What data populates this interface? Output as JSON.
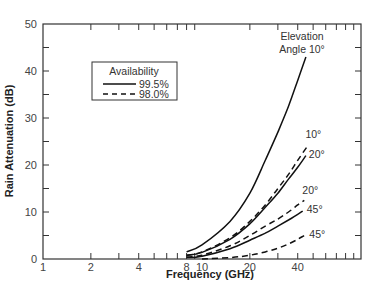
{
  "chart_data": {
    "type": "line",
    "title": "",
    "xlabel": "Frequency (GHz)",
    "ylabel": "Rain Attenuation (dB)",
    "xscale": "log",
    "xlim": [
      1,
      100
    ],
    "ylim": [
      0,
      50
    ],
    "x_tick_labels": [
      "1",
      "2",
      "4",
      "8",
      "10",
      "20",
      "40"
    ],
    "x_tick_values": [
      1,
      2,
      4,
      8,
      10,
      20,
      40
    ],
    "y_tick_labels": [
      "0",
      "10",
      "20",
      "30",
      "40",
      "50"
    ],
    "y_tick_values": [
      0,
      10,
      20,
      30,
      40,
      50
    ],
    "grid": false,
    "legend": {
      "title": "Availability",
      "position": "upper-left",
      "entries": [
        {
          "label": "99.5%",
          "style": "solid"
        },
        {
          "label": "98.0%",
          "style": "dashed"
        }
      ]
    },
    "annotations": [
      {
        "text": "Elevation",
        "x": 45,
        "y": 47
      },
      {
        "text": "Angle 10°",
        "x": 45,
        "y": 44.5
      }
    ],
    "series": [
      {
        "name": "10° (99.5%)",
        "label": "Elevation Angle 10°",
        "style": "solid",
        "x": [
          8,
          10,
          15,
          20,
          25,
          30,
          35,
          40,
          45
        ],
        "y": [
          1.5,
          3,
          8,
          14,
          21,
          27,
          32.5,
          38,
          43
        ]
      },
      {
        "name": "10° (98.0%)",
        "label": "10°",
        "style": "dashed",
        "x": [
          8,
          10,
          15,
          20,
          25,
          30,
          35,
          40,
          46
        ],
        "y": [
          0.8,
          1.5,
          4.5,
          8,
          11.5,
          15,
          18,
          21,
          24
        ]
      },
      {
        "name": "20° (99.5%)",
        "label": "20°",
        "style": "solid",
        "x": [
          8,
          10,
          15,
          20,
          25,
          30,
          35,
          40,
          45
        ],
        "y": [
          0.8,
          1.4,
          4.2,
          7.5,
          11,
          14,
          17,
          19.5,
          22
        ]
      },
      {
        "name": "20° (98.0%)",
        "label": "20°",
        "style": "dashed",
        "x": [
          8,
          10,
          15,
          20,
          25,
          30,
          35,
          40,
          44
        ],
        "y": [
          0.4,
          0.8,
          2.8,
          5,
          7,
          8.5,
          10,
          11.5,
          12.5
        ]
      },
      {
        "name": "45° (99.5%)",
        "label": "45°",
        "style": "solid",
        "x": [
          8,
          10,
          15,
          20,
          25,
          30,
          35,
          40,
          43
        ],
        "y": [
          0.3,
          0.6,
          2.2,
          4,
          5.5,
          7,
          8.3,
          9.5,
          10.2
        ]
      },
      {
        "name": "45° (98.0%)",
        "label": "45°",
        "style": "dashed",
        "x": [
          10,
          15,
          20,
          25,
          30,
          35,
          40,
          44
        ],
        "y": [
          0,
          0.3,
          0.8,
          1.5,
          2.3,
          3.2,
          4.2,
          5
        ]
      }
    ]
  }
}
